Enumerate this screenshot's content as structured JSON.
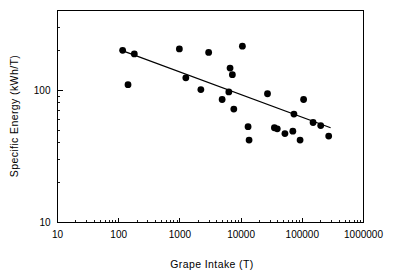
{
  "chart_data": {
    "type": "scatter",
    "title": "",
    "xlabel": "Grape Intake (T)",
    "ylabel": "Specific Energy  (kWh/T)",
    "xscale": "log",
    "yscale": "log",
    "xlim": [
      10,
      1000000
    ],
    "ylim": [
      10,
      400
    ],
    "grid": false,
    "legend": null,
    "xticks": [
      10,
      100,
      1000,
      10000,
      100000,
      1000000
    ],
    "xticklabels": [
      "10",
      "100",
      "1000",
      "10000",
      "100000",
      "1000000"
    ],
    "yticks": [
      10,
      100
    ],
    "yticklabels": [
      "10",
      "100"
    ],
    "series": [
      {
        "name": "Wineries",
        "marker": "filled-circle",
        "color": "#000000",
        "points": [
          {
            "x": 116,
            "y": 200
          },
          {
            "x": 180,
            "y": 188
          },
          {
            "x": 142,
            "y": 110
          },
          {
            "x": 980,
            "y": 205
          },
          {
            "x": 1250,
            "y": 124
          },
          {
            "x": 2200,
            "y": 101
          },
          {
            "x": 2950,
            "y": 193
          },
          {
            "x": 4900,
            "y": 85
          },
          {
            "x": 6300,
            "y": 97
          },
          {
            "x": 6600,
            "y": 147
          },
          {
            "x": 7200,
            "y": 131
          },
          {
            "x": 7600,
            "y": 72
          },
          {
            "x": 10500,
            "y": 215
          },
          {
            "x": 13000,
            "y": 53
          },
          {
            "x": 13500,
            "y": 42
          },
          {
            "x": 27000,
            "y": 94
          },
          {
            "x": 35000,
            "y": 52
          },
          {
            "x": 39000,
            "y": 51
          },
          {
            "x": 52000,
            "y": 47
          },
          {
            "x": 70000,
            "y": 49
          },
          {
            "x": 73000,
            "y": 66
          },
          {
            "x": 92000,
            "y": 42
          },
          {
            "x": 105000,
            "y": 85
          },
          {
            "x": 150000,
            "y": 57
          },
          {
            "x": 200000,
            "y": 54
          },
          {
            "x": 270000,
            "y": 45
          }
        ]
      }
    ],
    "fit_line": {
      "name": "linear-regression-log-log",
      "color": "#000000",
      "x_start": 120,
      "y_start": 197,
      "x_end": 290000,
      "y_end": 52
    }
  },
  "axes": {
    "x_axis_title": "Grape Intake (T)",
    "y_axis_title": "Specific Energy  (kWh/T)"
  }
}
